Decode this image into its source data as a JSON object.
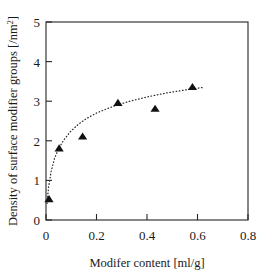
{
  "chart_data": {
    "type": "scatter",
    "title": "",
    "xlabel": "Modifer content [ml/g]",
    "ylabel_main": "Density of surface modifier groups [/nm",
    "ylabel_sup": "2",
    "ylabel_tail": "]",
    "ylabel_full": "Density of surface modifier groups [/nm2]",
    "xlim": [
      0,
      0.8
    ],
    "ylim": [
      0,
      5
    ],
    "xticks": [
      "0",
      "0.2",
      "0.4",
      "0.6",
      "0.8"
    ],
    "xtick_values": [
      0,
      0.2,
      0.4,
      0.6,
      0.8
    ],
    "yticks": [
      "0",
      "1",
      "2",
      "3",
      "4",
      "5"
    ],
    "ytick_values": [
      0,
      1,
      2,
      3,
      4,
      5
    ],
    "grid": false,
    "legend": null,
    "marker": "filled-triangle",
    "marker_color": "#111111",
    "trendline": {
      "style": "dotted",
      "color": "#2b2b2b",
      "description": "logarithmic fit through points"
    },
    "series": [
      {
        "name": "Density of surface modifier groups",
        "x": [
          0.012,
          0.052,
          0.145,
          0.285,
          0.432,
          0.58
        ],
        "y": [
          0.52,
          1.8,
          2.1,
          2.95,
          2.8,
          3.35
        ]
      }
    ],
    "trend_points": {
      "x": [
        0.004,
        0.01,
        0.02,
        0.034,
        0.05,
        0.07,
        0.095,
        0.125,
        0.16,
        0.2,
        0.245,
        0.295,
        0.35,
        0.41,
        0.47,
        0.53,
        0.59,
        0.625
      ],
      "y": [
        0.42,
        0.82,
        1.22,
        1.56,
        1.8,
        2.02,
        2.22,
        2.4,
        2.56,
        2.7,
        2.82,
        2.93,
        3.03,
        3.12,
        3.2,
        3.26,
        3.32,
        3.35
      ]
    }
  },
  "axes": {
    "x_axis_name": "x-axis",
    "y_axis_name": "y-axis"
  }
}
